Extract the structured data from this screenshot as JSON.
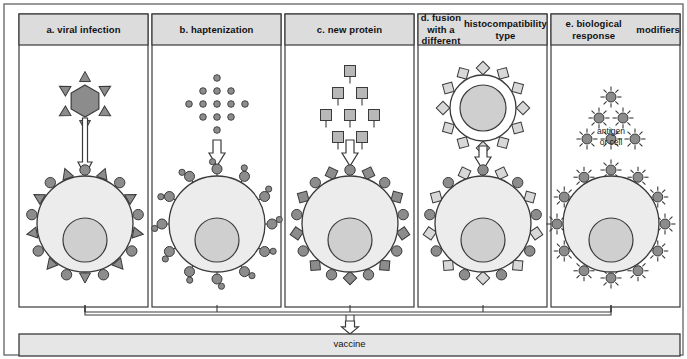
{
  "figure": {
    "title_caption": "",
    "outer_frame": {
      "x": 4,
      "y": 4,
      "width": 679,
      "height": 351
    },
    "colors": {
      "header_fill": "#dcdcdc",
      "panel_fill": "#ffffff",
      "cell_fill": "#ececec",
      "nucleus_fill": "#cfcfcf",
      "receptor_dark": "#8c8c8c",
      "receptor_light": "#d8d8d8",
      "stroke": "#3a3a3a",
      "frame_stroke": "#6e6e6e",
      "vaccine_fill": "#e6e6e6",
      "text": "#111111"
    }
  },
  "panels": [
    {
      "id": "a",
      "label": "a.  viral infection",
      "box": {
        "x": 19,
        "y": 14,
        "width": 129,
        "height": 293
      },
      "header_height": 31,
      "agent": {
        "kind": "virus-hexagon",
        "cx": 85,
        "cy": 101,
        "radius": 16,
        "spikes": 6,
        "fill": "#8c8c8c"
      },
      "arrow": {
        "kind": "hollow-down-arrow",
        "x": 85,
        "y_top": 118,
        "y_bottom": 175,
        "style": "long-shaft"
      },
      "cell": {
        "cx": 85,
        "cy": 224,
        "radius": 48,
        "nucleus": {
          "cx": 85,
          "cy": 240,
          "radius": 22
        },
        "receptors": {
          "count": 18,
          "pattern": "alternating-circle-triangle",
          "fill": "#8c8c8c"
        }
      }
    },
    {
      "id": "b",
      "label": "b.  haptenization",
      "box": {
        "x": 152,
        "y": 14,
        "width": 129,
        "height": 293
      },
      "header_height": 31,
      "agent": {
        "kind": "hapten-dot-diamond",
        "cx": 217,
        "cy": 104,
        "rows": [
          1,
          3,
          5,
          3,
          1
        ],
        "dot_radius": 3.3,
        "spacing_x": 14,
        "spacing_y": 13,
        "fill": "#8c8c8c"
      },
      "arrow": {
        "kind": "hollow-down-arrow",
        "x": 217,
        "y_top": 140,
        "y_bottom": 166,
        "style": "short"
      },
      "cell": {
        "cx": 217,
        "cy": 224,
        "radius": 48,
        "nucleus": {
          "cx": 217,
          "cy": 240,
          "radius": 22
        },
        "receptors": {
          "count": 12,
          "pattern": "circle-with-hapten",
          "fill": "#8c8c8c"
        }
      }
    },
    {
      "id": "c",
      "label": "c.  new protein",
      "box": {
        "x": 285,
        "y": 14,
        "width": 129,
        "height": 293
      },
      "header_height": 31,
      "agent": {
        "kind": "protein-square-cluster",
        "cx": 350,
        "cy": 104,
        "rows": [
          1,
          2,
          3,
          2
        ],
        "square_size": 11,
        "spacing_x": 24,
        "spacing_y": 22,
        "fill": "#b8b8b8"
      },
      "arrow": {
        "kind": "hollow-down-arrow",
        "x": 350,
        "y_top": 140,
        "y_bottom": 166,
        "style": "short"
      },
      "cell": {
        "cx": 350,
        "cy": 224,
        "radius": 48,
        "nucleus": {
          "cx": 350,
          "cy": 240,
          "radius": 22
        },
        "receptors": {
          "count": 18,
          "pattern": "alternating-circle-square",
          "fill": "#8c8c8c"
        }
      }
    },
    {
      "id": "d",
      "label": "d. fusion with a different histocompatibility type",
      "label_lines": [
        "d. fusion with a different",
        "histocompatibility type"
      ],
      "box": {
        "x": 418,
        "y": 14,
        "width": 129,
        "height": 293
      },
      "header_height": 31,
      "agent": {
        "kind": "foreign-cell-square-receptors",
        "cx": 483,
        "cy": 108,
        "radius": 33,
        "nucleus_radius": 23,
        "receptors": {
          "count": 12,
          "pattern": "square",
          "fill": "#d8d8d8"
        }
      },
      "arrow": {
        "kind": "hollow-down-arrow",
        "x": 483,
        "y_top": 146,
        "y_bottom": 170,
        "style": "short"
      },
      "cell": {
        "cx": 483,
        "cy": 224,
        "radius": 48,
        "nucleus": {
          "cx": 483,
          "cy": 240,
          "radius": 22
        },
        "receptors": {
          "count": 18,
          "pattern": "alternating-circle-square-light",
          "fill": "#8c8c8c"
        }
      }
    },
    {
      "id": "e",
      "label": "e.  biological response modifiers",
      "label_lines": [
        "e.  biological response",
        "modifiers"
      ],
      "box": {
        "x": 551,
        "y": 14,
        "width": 129,
        "height": 293
      },
      "header_height": 31,
      "agent": {
        "kind": "starburst-cluster",
        "cx": 611,
        "cy": 97,
        "rows": [
          1,
          2,
          3
        ],
        "dot_radius": 5,
        "ray_count": 8,
        "spacing_x": 24,
        "spacing_y": 21,
        "fill": "#8c8c8c"
      },
      "inline_label": {
        "text_lines": [
          "antigen",
          "or cell"
        ],
        "x": 611,
        "y": 126
      },
      "cell": {
        "cx": 611,
        "cy": 224,
        "radius": 48,
        "nucleus": {
          "cx": 611,
          "cy": 240,
          "radius": 22
        },
        "receptors": {
          "count": 12,
          "pattern": "starburst",
          "fill": "#8c8c8c"
        }
      }
    }
  ],
  "connector": {
    "kind": "converging-bracket",
    "bracket_y": 312,
    "drop_depth": 7,
    "panel_centers": [
      85,
      217,
      350,
      483,
      611
    ],
    "merge_x": 350,
    "arrow": {
      "x": 350,
      "y_top": 321,
      "y_bottom": 334
    }
  },
  "vaccine_bar": {
    "label": "vaccine",
    "box": {
      "x": 19,
      "y": 334,
      "width": 661,
      "height": 22
    },
    "fill": "#e6e6e6"
  }
}
